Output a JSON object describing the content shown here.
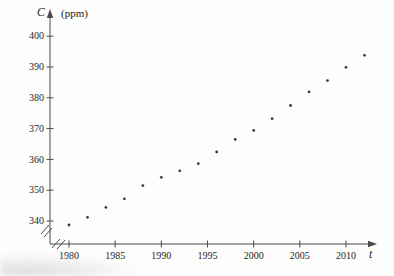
{
  "figure": {
    "background": "#fdfdfc",
    "ink_color": "#4a4a4a",
    "text_color": "#1f1f1f",
    "point_color": "#3c3c3c",
    "y_axis_variable": "C",
    "y_axis_unit": "(ppm)",
    "x_axis_variable": "t"
  },
  "chart_data": {
    "type": "scatter",
    "title": "",
    "xlabel": "t",
    "ylabel": "C (ppm)",
    "x_ticks": [
      1980,
      1985,
      1990,
      1995,
      2000,
      2005,
      2010
    ],
    "y_ticks": [
      340,
      350,
      360,
      370,
      380,
      390,
      400
    ],
    "xlim": [
      1978.5,
      2013.5
    ],
    "ylim": [
      336,
      403
    ],
    "grid": false,
    "legend": "none",
    "axis_break_x": true,
    "axis_break_y": true,
    "series": [
      {
        "name": "average-co2-level",
        "x": [
          1980,
          1982,
          1984,
          1986,
          1988,
          1990,
          1992,
          1994,
          1996,
          1998,
          2000,
          2002,
          2004,
          2006,
          2008,
          2010,
          2012
        ],
        "y": [
          338.7,
          341.2,
          344.4,
          347.2,
          351.5,
          354.2,
          356.3,
          358.6,
          362.4,
          366.5,
          369.4,
          373.2,
          377.5,
          381.9,
          385.6,
          389.9,
          393.8
        ]
      }
    ]
  }
}
